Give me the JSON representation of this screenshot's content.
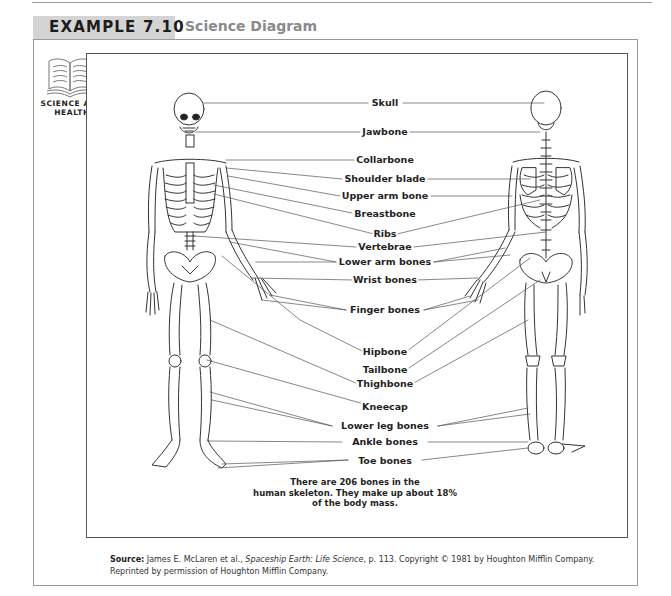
{
  "header": {
    "example_label": "EXAMPLE 7.10",
    "example_title": "Science Diagram"
  },
  "sidebar": {
    "icon": "open-book-icon",
    "subject_line1": "SCIENCE AND",
    "subject_line2": "HEALTH"
  },
  "diagram": {
    "figures": [
      "front-skeleton",
      "back-skeleton"
    ],
    "labels": [
      {
        "text": "Skull",
        "x": 385,
        "y": 75
      },
      {
        "text": "Jawbone",
        "x": 385,
        "y": 104
      },
      {
        "text": "Collarbone",
        "x": 385,
        "y": 152
      },
      {
        "text": "Shoulder blade",
        "x": 385,
        "y": 174
      },
      {
        "text": "Upper arm bone",
        "x": 385,
        "y": 191
      },
      {
        "text": "Breastbone",
        "x": 385,
        "y": 209
      },
      {
        "text": "Ribs",
        "x": 385,
        "y": 231
      },
      {
        "text": "Vertebrae",
        "x": 385,
        "y": 243
      },
      {
        "text": "Lower arm bones",
        "x": 385,
        "y": 258
      },
      {
        "text": "Wrist bones",
        "x": 385,
        "y": 275
      },
      {
        "text": "Finger bones",
        "x": 385,
        "y": 305
      },
      {
        "text": "Hipbone",
        "x": 385,
        "y": 348
      },
      {
        "text": "Tailbone",
        "x": 385,
        "y": 366
      },
      {
        "text": "Thighbone",
        "x": 385,
        "y": 380
      },
      {
        "text": "Kneecap",
        "x": 385,
        "y": 400
      },
      {
        "text": "Lower leg bones",
        "x": 385,
        "y": 423
      },
      {
        "text": "Ankle bones",
        "x": 385,
        "y": 438
      },
      {
        "text": "Toe bones",
        "x": 385,
        "y": 456
      }
    ],
    "caption_line1": "There are 206 bones in the",
    "caption_line2": "human skeleton. They make up about 18%",
    "caption_line3": "of the body mass."
  },
  "source": {
    "label": "Source:",
    "authors": " James E. McLaren et al., ",
    "book_title": "Spaceship Earth: Life Science",
    "details": ", p. 113. Copyright © 1981 by Houghton Mifflin Company.",
    "line2": "Reprinted by permission of Houghton Mifflin Company."
  }
}
